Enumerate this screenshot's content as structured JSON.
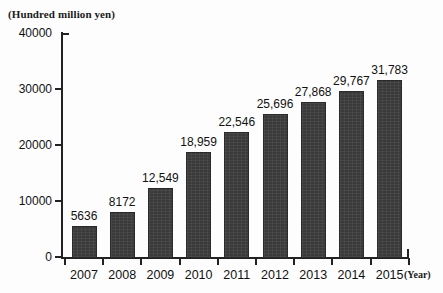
{
  "chart_data": {
    "type": "bar",
    "title": "",
    "xlabel": "(Year)",
    "ylabel": "(Hundred million yen)",
    "categories": [
      "2007",
      "2008",
      "2009",
      "2010",
      "2011",
      "2012",
      "2013",
      "2014",
      "2015"
    ],
    "values": [
      5636,
      8172,
      12549,
      18959,
      22546,
      25696,
      27868,
      29767,
      31783
    ],
    "value_labels": [
      "5636",
      "8172",
      "12,549",
      "18,959",
      "22,546",
      "25,696",
      "27,868",
      "29,767",
      "31,783"
    ],
    "ylim": [
      0,
      40000
    ],
    "ytick_labels": [
      "0",
      "10000",
      "20000",
      "30000",
      "40000"
    ],
    "ytick_values": [
      0,
      10000,
      20000,
      30000,
      40000
    ],
    "grid": false,
    "legend": "none",
    "series_color": "#3a3a3a",
    "axis_color": "#222222",
    "background_color": "#fdfdfd"
  }
}
